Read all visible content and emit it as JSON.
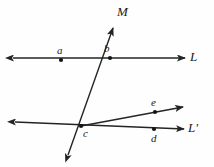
{
  "figure": {
    "kind": "geometry-diagram",
    "background_color": "#fefefe",
    "stroke_color": "#242424",
    "width": 214,
    "height": 167
  },
  "labels": {
    "line_L": "L",
    "line_L_prime": "L'",
    "line_M": "M",
    "point_a": "a",
    "point_b": "b",
    "point_c": "c",
    "point_d": "d",
    "point_e": "e"
  },
  "chart_data": {
    "type": "scatter",
    "title": "",
    "xlabel": "",
    "ylabel": "",
    "points": [
      {
        "name": "a",
        "x": 61,
        "y": 60,
        "label": "a",
        "label_x": 57,
        "label_y": 46
      },
      {
        "name": "b",
        "x": 110,
        "y": 58,
        "label": "b",
        "label_x": 104,
        "label_y": 44
      },
      {
        "name": "c",
        "x": 81,
        "y": 126,
        "label": "c",
        "label_x": 83,
        "label_y": 128
      },
      {
        "name": "d",
        "x": 154,
        "y": 129,
        "label": "d",
        "label_x": 151,
        "label_y": 132
      },
      {
        "name": "e",
        "x": 155,
        "y": 112,
        "label": "e",
        "label_x": 151,
        "label_y": 98
      }
    ],
    "lines": [
      {
        "name": "L",
        "x1": 13,
        "y1": 58,
        "x2": 185,
        "y2": 58,
        "arrow_start": true,
        "arrow_end": true,
        "label": "L",
        "label_x": 190,
        "label_y": 51
      },
      {
        "name": "M",
        "x1": 68,
        "y1": 155,
        "x2": 113,
        "y2": 28,
        "arrow_start": true,
        "arrow_end": true,
        "label": "M",
        "label_x": 117,
        "label_y": 6
      },
      {
        "name": "L-prime",
        "x1": 15,
        "y1": 122,
        "x2": 184,
        "y2": 129,
        "arrow_start": true,
        "arrow_end": true,
        "label": "L'",
        "label_x": 190,
        "label_y": 122
      },
      {
        "name": "ray-ce",
        "x1": 81,
        "y1": 126,
        "x2": 183,
        "y2": 107,
        "arrow_start": false,
        "arrow_end": true,
        "label": "",
        "label_x": 0,
        "label_y": 0
      }
    ]
  }
}
